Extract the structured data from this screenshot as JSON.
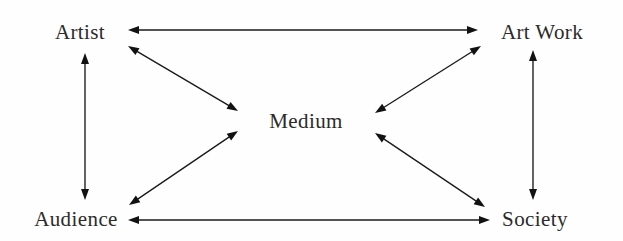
{
  "diagram": {
    "background_color": "#fefefe",
    "line_color": "#1a1a1a",
    "text_color": "#2b2b2b",
    "nodes": [
      {
        "id": "artist",
        "label": "Artist",
        "x": 80,
        "y": 39,
        "anchor": "middle"
      },
      {
        "id": "artwork",
        "label": "Art Work",
        "x": 542,
        "y": 39,
        "anchor": "middle"
      },
      {
        "id": "medium",
        "label": "Medium",
        "x": 306,
        "y": 128,
        "anchor": "middle"
      },
      {
        "id": "audience",
        "label": "Audience",
        "x": 76,
        "y": 226,
        "anchor": "middle"
      },
      {
        "id": "society",
        "label": "Society",
        "x": 535,
        "y": 226,
        "anchor": "middle"
      }
    ],
    "edges": [
      {
        "id": "artist-artwork",
        "from": "artist",
        "to": "artwork",
        "x1": 128,
        "y1": 30,
        "x2": 478,
        "y2": 30,
        "arrows": "both"
      },
      {
        "id": "audience-society",
        "from": "audience",
        "to": "society",
        "x1": 128,
        "y1": 220,
        "x2": 490,
        "y2": 220,
        "arrows": "both"
      },
      {
        "id": "artist-audience",
        "from": "artist",
        "to": "audience",
        "x1": 85,
        "y1": 53,
        "x2": 85,
        "y2": 200,
        "arrows": "both"
      },
      {
        "id": "artwork-society",
        "from": "artwork",
        "to": "society",
        "x1": 533,
        "y1": 50,
        "x2": 533,
        "y2": 200,
        "arrows": "both"
      },
      {
        "id": "artist-medium",
        "from": "artist",
        "to": "medium",
        "x1": 128,
        "y1": 46,
        "x2": 238,
        "y2": 111,
        "arrows": "both"
      },
      {
        "id": "medium-artwork",
        "from": "medium",
        "to": "artwork",
        "x1": 375,
        "y1": 113,
        "x2": 481,
        "y2": 46,
        "arrows": "both"
      },
      {
        "id": "audience-medium",
        "from": "audience",
        "to": "medium",
        "x1": 129,
        "y1": 205,
        "x2": 238,
        "y2": 131,
        "arrows": "both"
      },
      {
        "id": "medium-society",
        "from": "medium",
        "to": "society",
        "x1": 375,
        "y1": 133,
        "x2": 485,
        "y2": 207,
        "arrows": "both"
      }
    ],
    "arrow_head": {
      "length": 11,
      "half_width": 4
    }
  }
}
